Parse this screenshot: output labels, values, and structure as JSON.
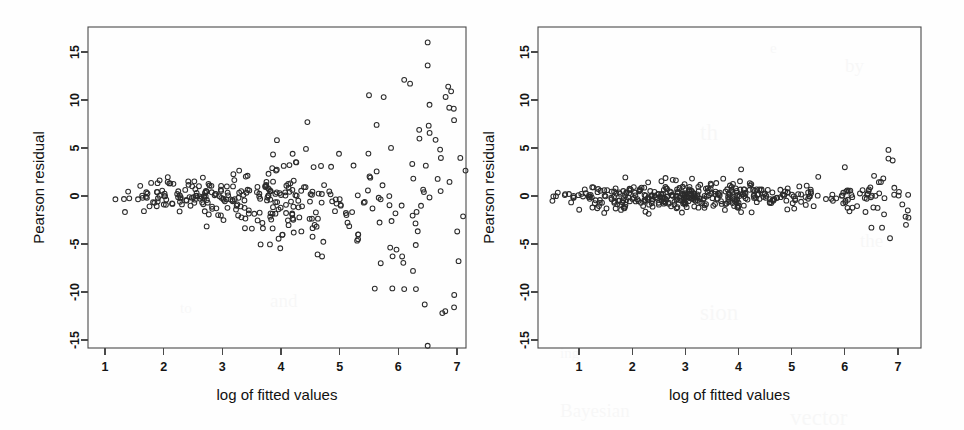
{
  "figure": {
    "title": "",
    "panel_count": 2,
    "background_color": "#fefefe",
    "ink_color": "#2b2b2b",
    "axis_color": "#4a4a4a"
  },
  "panels": [
    {
      "id": "left",
      "name": "poisson-residuals-panel",
      "xlabel": "log of fitted values",
      "ylabel": "Pearson residual"
    },
    {
      "id": "right",
      "name": "quasipoisson-residuals-panel",
      "xlabel": "log of fitted values",
      "ylabel": "Pearson residual"
    }
  ],
  "chart_data": [
    {
      "type": "scatter",
      "panel": "left",
      "title": "",
      "xlabel": "log of fitted values",
      "ylabel": "Pearson residual",
      "xlim": [
        0.55,
        7.35
      ],
      "ylim": [
        -17.0,
        17.0
      ],
      "xticks": [
        1,
        2,
        3,
        4,
        5,
        6,
        7
      ],
      "xticklabels": [
        "1",
        "2",
        "3",
        "4",
        "5",
        "6",
        "7"
      ],
      "yticks": [
        -15,
        -10,
        -5,
        0,
        5,
        10,
        15
      ],
      "yticklabels": [
        "-15",
        "-10",
        "-5",
        "0",
        "5",
        "10",
        "15"
      ],
      "grid": false,
      "legend": null,
      "marker": "open-circle",
      "marker_radius_px": 2.4,
      "n_points": 330,
      "description": "Residual spread fans out strongly with fitted value (heteroscedastic)",
      "spread_model": {
        "form": "sd = 0.55 * exp(0.42 * (x - 1))",
        "base_sd": 0.55,
        "growth_rate": 0.42
      },
      "seed": 20413,
      "x_range_data": [
        1.05,
        7.15
      ],
      "y_range_data": [
        -15.6,
        16.0
      ],
      "notable_points": [
        {
          "x": 6.5,
          "y": 16.0
        },
        {
          "x": 6.5,
          "y": 13.6
        },
        {
          "x": 6.1,
          "y": 12.1
        },
        {
          "x": 6.2,
          "y": 11.7
        },
        {
          "x": 6.85,
          "y": 11.4
        },
        {
          "x": 6.9,
          "y": 10.9
        },
        {
          "x": 5.5,
          "y": 10.5
        },
        {
          "x": 5.75,
          "y": 10.3
        },
        {
          "x": 4.45,
          "y": 7.7
        },
        {
          "x": 6.95,
          "y": 7.9
        },
        {
          "x": 6.5,
          "y": -15.6
        },
        {
          "x": 6.75,
          "y": -12.2
        },
        {
          "x": 6.8,
          "y": -12.0
        },
        {
          "x": 6.45,
          "y": -11.3
        },
        {
          "x": 6.95,
          "y": -11.6
        },
        {
          "x": 6.1,
          "y": -9.7
        },
        {
          "x": 6.3,
          "y": -9.7
        },
        {
          "x": 6.25,
          "y": -7.8
        },
        {
          "x": 5.7,
          "y": -7.0
        },
        {
          "x": 4.7,
          "y": -6.3
        }
      ]
    },
    {
      "type": "scatter",
      "panel": "right",
      "title": "",
      "xlabel": "log of fitted values",
      "ylabel": "Pearson residual",
      "xlim": [
        0.35,
        7.4
      ],
      "ylim": [
        -17.0,
        17.0
      ],
      "xticks": [
        1,
        2,
        3,
        4,
        5,
        6,
        7
      ],
      "xticklabels": [
        "1",
        "2",
        "3",
        "4",
        "5",
        "6",
        "7"
      ],
      "yticks": [
        -15,
        -10,
        -5,
        0,
        5,
        10,
        15
      ],
      "yticklabels": [
        "-15",
        "-10",
        "-5",
        "0",
        "5",
        "10",
        "15"
      ],
      "grid": false,
      "legend": null,
      "marker": "open-circle",
      "marker_radius_px": 2.4,
      "n_points": 430,
      "description": "Residuals form a narrow homoscedastic band centred on zero",
      "spread_model": {
        "form": "sd = 0.72 constant with slight widening above x = 5",
        "base_sd": 0.72,
        "growth_rate": 0.06
      },
      "seed": 77219,
      "x_range_data": [
        0.5,
        7.2
      ],
      "y_range_data": [
        -4.4,
        4.8
      ],
      "notable_points": [
        {
          "x": 6.82,
          "y": 4.8
        },
        {
          "x": 6.82,
          "y": 3.9
        },
        {
          "x": 6.9,
          "y": 3.7
        },
        {
          "x": 6.0,
          "y": 3.0
        },
        {
          "x": 6.55,
          "y": 2.1
        },
        {
          "x": 5.5,
          "y": 2.0
        },
        {
          "x": 6.85,
          "y": -4.4
        },
        {
          "x": 7.15,
          "y": -3.0
        },
        {
          "x": 6.5,
          "y": -3.3
        },
        {
          "x": 6.7,
          "y": -3.3
        },
        {
          "x": 0.5,
          "y": -0.5
        }
      ]
    }
  ],
  "ghost_text": [
    {
      "text": "e",
      "x": 770,
      "y": 40
    },
    {
      "text": "by",
      "x": 845,
      "y": 55
    },
    {
      "text": "th",
      "x": 700,
      "y": 120
    },
    {
      "text": "list",
      "x": 610,
      "y": 200
    },
    {
      "text": "the",
      "x": 860,
      "y": 230
    },
    {
      "text": "sion",
      "x": 700,
      "y": 300
    },
    {
      "text": "ing",
      "x": 560,
      "y": 345
    },
    {
      "text": "Bayesian",
      "x": 560,
      "y": 400
    },
    {
      "text": "vector",
      "x": 790,
      "y": 405
    },
    {
      "text": "to",
      "x": 180,
      "y": 300
    },
    {
      "text": "and",
      "x": 270,
      "y": 290
    }
  ]
}
